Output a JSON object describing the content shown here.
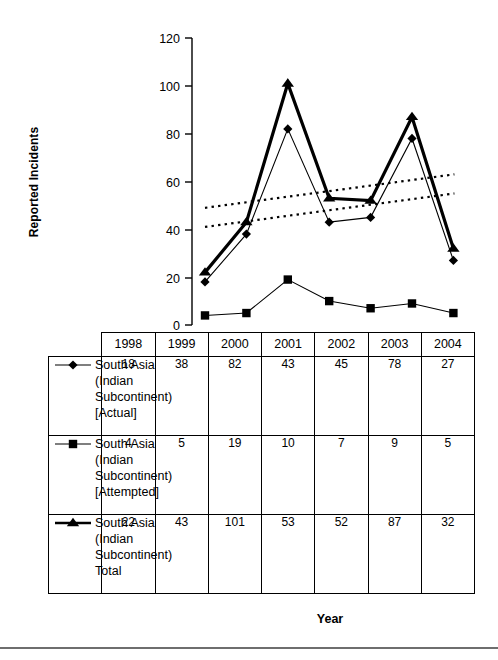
{
  "chart_data": {
    "type": "line",
    "title": "",
    "xlabel": "Year",
    "ylabel": "Reported Incidents",
    "categories": [
      "1998",
      "1999",
      "2000",
      "2001",
      "2002",
      "2003",
      "2004"
    ],
    "ylim": [
      0,
      120
    ],
    "yticks": [
      0,
      20,
      40,
      60,
      80,
      100,
      120
    ],
    "grid": false,
    "legend_position": "table-below",
    "series": [
      {
        "name": "South Asia (Indian Subcontinent) [Actual]",
        "marker": "diamond",
        "line": "thin-solid",
        "values": [
          18,
          38,
          82,
          43,
          45,
          78,
          27
        ]
      },
      {
        "name": "South Asia (Indian Subcontinent) [Attempted]",
        "marker": "square",
        "line": "thin-solid",
        "values": [
          4,
          5,
          19,
          10,
          7,
          9,
          5
        ]
      },
      {
        "name": "South Asia (Indian Subcontinent) Total",
        "marker": "triangle",
        "line": "thick-solid",
        "values": [
          22,
          43,
          101,
          53,
          52,
          87,
          32
        ]
      }
    ],
    "trendlines": [
      {
        "name": "upper-trendline",
        "style": "dotted",
        "start": [
          1998,
          49
        ],
        "end": [
          2004,
          63
        ]
      },
      {
        "name": "lower-trendline",
        "style": "dotted",
        "start": [
          1998,
          41
        ],
        "end": [
          2004,
          55
        ]
      }
    ]
  },
  "axis": {
    "y_title": "Reported Incidents",
    "x_title": "Year",
    "y_tick_labels": [
      "120",
      "100",
      "80",
      "60",
      "40",
      "20",
      "0"
    ]
  },
  "table": {
    "column_headers": [
      "1998",
      "1999",
      "2000",
      "2001",
      "2002",
      "2003",
      "2004"
    ],
    "rows": [
      {
        "marker": "diamond",
        "label": "South Asia\n(Indian\nSubcontinent)\n[Actual]",
        "values": [
          "18",
          "38",
          "82",
          "43",
          "45",
          "78",
          "27"
        ]
      },
      {
        "marker": "square",
        "label": "South Asia\n(Indian\nSubcontinent)\n[Attempted]",
        "values": [
          "4",
          "5",
          "19",
          "10",
          "7",
          "9",
          "5"
        ]
      },
      {
        "marker": "triangle",
        "label": "South Asia\n(Indian\nSubcontinent)\nTotal",
        "values": [
          "22",
          "43",
          "101",
          "53",
          "52",
          "87",
          "32"
        ]
      }
    ]
  },
  "colors": {
    "ink": "#000000",
    "background": "#ffffff",
    "rule": "#6e6e6e"
  }
}
